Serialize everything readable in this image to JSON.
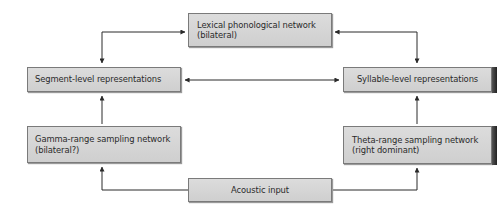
{
  "diagram": {
    "nodes": {
      "lexical": {
        "line1": "Lexical phonological network",
        "line2": "(bilateral)"
      },
      "segment": {
        "line1": "Segment-level representations"
      },
      "syllable": {
        "line1": "Syllable-level representations"
      },
      "gamma": {
        "line1": "Gamma-range sampling network",
        "line2": "(bilateral?)"
      },
      "theta": {
        "line1": "Theta-range sampling network",
        "line2": "(right dominant)"
      },
      "acoustic": {
        "line1": "Acoustic input"
      }
    },
    "edges": [
      {
        "from": "segment",
        "to": "lexical",
        "direction": "bidirectional"
      },
      {
        "from": "syllable",
        "to": "lexical",
        "direction": "bidirectional"
      },
      {
        "from": "segment",
        "to": "syllable",
        "direction": "bidirectional"
      },
      {
        "from": "gamma",
        "to": "segment",
        "direction": "forward"
      },
      {
        "from": "theta",
        "to": "syllable",
        "direction": "forward"
      },
      {
        "from": "acoustic",
        "to": "gamma",
        "direction": "forward"
      },
      {
        "from": "acoustic",
        "to": "theta",
        "direction": "forward"
      }
    ]
  }
}
